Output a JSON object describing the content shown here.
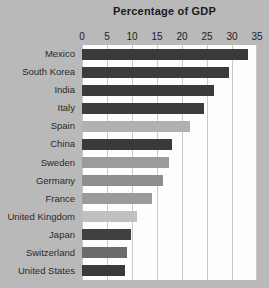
{
  "chart_data": {
    "type": "bar",
    "orientation": "horizontal",
    "title": "Percentage of GDP",
    "xlabel": "",
    "ylabel": "",
    "xlim": [
      0,
      35
    ],
    "xticks": [
      0,
      5,
      10,
      15,
      20,
      25,
      30,
      35
    ],
    "xtick_labels": [
      "0",
      "5",
      "10",
      "15",
      "20",
      "25",
      "30",
      "35"
    ],
    "grid": true,
    "legend": "none",
    "categories": [
      "Mexico",
      "South Korea",
      "India",
      "Italy",
      "Spain",
      "China",
      "Sweden",
      "Germany",
      "France",
      "United Kingdom",
      "Japan",
      "Switzerland",
      "United States"
    ],
    "values": [
      33.2,
      29.4,
      26.4,
      24.3,
      21.5,
      17.9,
      17.4,
      16.2,
      14.0,
      11.0,
      9.7,
      9.0,
      8.6
    ],
    "bar_colors": [
      "#3a3a3a",
      "#3c3c3c",
      "#3a3a3a",
      "#3c3c3c",
      "#b0b0b0",
      "#3a3a3a",
      "#9b9b9b",
      "#8e8e8e",
      "#9b9b9b",
      "#c0c0c0",
      "#404040",
      "#6b6b6b",
      "#3a3a3a"
    ]
  },
  "colors": {
    "background": "#b9b9b9",
    "plot_background": "#fdfdfd",
    "gridline": "#c9c9c9",
    "text": "#1b1b1b",
    "label_text": "#2a2a2a"
  }
}
